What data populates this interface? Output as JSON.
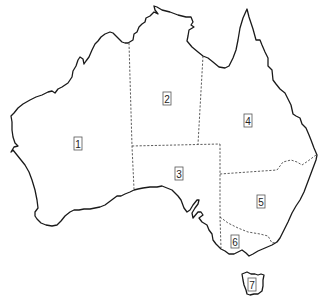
{
  "map": {
    "subject": "Australia",
    "colors": {
      "background": "#ffffff",
      "coastline": "#1a1a1a",
      "borders": "#333333",
      "label_border": "#555555"
    },
    "regions": [
      {
        "id": "1",
        "label": "1",
        "x": 78,
        "y": 144
      },
      {
        "id": "2",
        "label": "2",
        "x": 167,
        "y": 99
      },
      {
        "id": "3",
        "label": "3",
        "x": 179,
        "y": 174
      },
      {
        "id": "4",
        "label": "4",
        "x": 248,
        "y": 121
      },
      {
        "id": "5",
        "label": "5",
        "x": 261,
        "y": 202
      },
      {
        "id": "6",
        "label": "6",
        "x": 235,
        "y": 242
      },
      {
        "id": "7",
        "label": "7",
        "x": 252,
        "y": 285
      }
    ]
  }
}
